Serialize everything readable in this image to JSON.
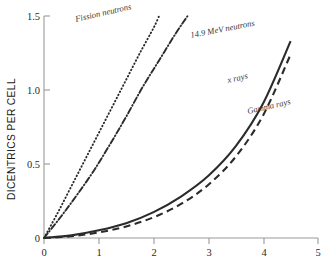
{
  "chart_data": {
    "type": "line",
    "title": "",
    "xlabel": "",
    "ylabel": "DICENTRICS PER CELL",
    "xlim": [
      0,
      5
    ],
    "ylim": [
      0,
      1.5
    ],
    "xticks": [
      "0",
      "1",
      "2",
      "3",
      "4",
      "5"
    ],
    "yticks": [
      "0",
      "0.5",
      "1.0",
      "1.5"
    ],
    "ytick_values": [
      0,
      0.5,
      1.0,
      1.5
    ],
    "xtick_values": [
      0,
      1,
      2,
      3,
      4,
      5
    ],
    "grid": false,
    "legend_position": "inline-annotations",
    "series": [
      {
        "name": "Fission neutrons",
        "style": "dotted",
        "color": "#2b2b2b",
        "x": [
          0,
          0.25,
          0.5,
          0.75,
          1.0,
          1.25,
          1.5,
          1.75,
          2.0,
          2.1
        ],
        "values": [
          0,
          0.17,
          0.35,
          0.53,
          0.71,
          0.89,
          1.07,
          1.25,
          1.42,
          1.5
        ]
      },
      {
        "name": "14.9 MeV neutrons",
        "style": "dash-dot",
        "color": "#2b2b2b",
        "x": [
          0,
          0.3,
          0.6,
          0.9,
          1.2,
          1.5,
          1.8,
          2.1,
          2.4,
          2.62
        ],
        "values": [
          0,
          0.14,
          0.29,
          0.45,
          0.63,
          0.82,
          1.02,
          1.2,
          1.38,
          1.5
        ]
      },
      {
        "name": "x rays",
        "style": "solid",
        "color": "#2b2b2b",
        "x": [
          0,
          0.5,
          1.0,
          1.5,
          2.0,
          2.5,
          3.0,
          3.5,
          4.0,
          4.5
        ],
        "values": [
          0,
          0.018,
          0.052,
          0.1,
          0.175,
          0.28,
          0.42,
          0.62,
          0.91,
          1.33
        ]
      },
      {
        "name": "Gamma rays",
        "style": "dashed",
        "color": "#2b2b2b",
        "x": [
          0,
          0.5,
          1.0,
          1.5,
          2.0,
          2.5,
          3.0,
          3.5,
          4.0,
          4.5
        ],
        "values": [
          0,
          0.012,
          0.038,
          0.078,
          0.14,
          0.23,
          0.36,
          0.55,
          0.83,
          1.24
        ]
      }
    ],
    "annotations": [
      {
        "text": "Fission neutrons",
        "x_px": 76,
        "y_px": 22,
        "rotate": -13
      },
      {
        "text": "14.9 MeV neutrons",
        "x_px": 191,
        "y_px": 38,
        "rotate": -11
      },
      {
        "text": "x rays",
        "x_px": 228,
        "y_px": 83,
        "rotate": -13
      },
      {
        "text": "Gamma rays",
        "x_px": 248,
        "y_px": 114,
        "rotate": -13
      }
    ]
  }
}
